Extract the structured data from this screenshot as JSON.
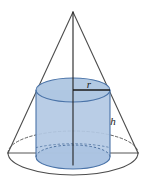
{
  "figure": {
    "labels": {
      "radius": "r",
      "height": "h"
    },
    "colors": {
      "cylinder_fill": "#b3c9e4",
      "cylinder_top_fill": "#a9c2e0",
      "cylinder_stroke": "#4a73a8",
      "outline_stroke": "#4d4d4d",
      "label_color": "#1a1a1a",
      "background": "#ffffff"
    },
    "geometry": {
      "apex": {
        "x": 73,
        "y": 12
      },
      "cone_base_center": {
        "x": 73,
        "y": 153
      },
      "cone_base_rx": 65,
      "cone_base_ry": 22,
      "cylinder_center_x": 73,
      "cylinder_rx": 37,
      "cylinder_ry": 12,
      "cylinder_top_y": 90,
      "cylinder_bottom_y": 157,
      "radius_line": {
        "x1": 73,
        "y1": 90,
        "x2": 110,
        "y2": 90
      },
      "axis_line": {
        "x1": 73,
        "y1": 12,
        "x2": 73,
        "y2": 165
      },
      "diameter_line": {
        "x1": 8,
        "y1": 153,
        "x2": 138,
        "y2": 153
      }
    },
    "label_positions": {
      "radius": {
        "x": 89,
        "y": 88
      },
      "height": {
        "x": 113,
        "y": 125
      }
    }
  }
}
